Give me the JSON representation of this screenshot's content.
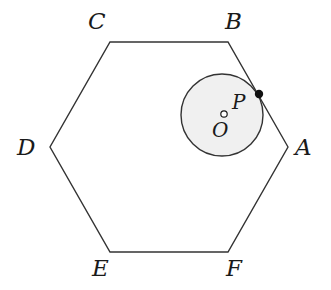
{
  "figure": {
    "kind": "geometry-diagram",
    "background_color": "#ffffff",
    "stroke_color": "#333333",
    "label_color": "#1a1a1a"
  },
  "hexagon": {
    "name": "ABCDEF",
    "stroke_color": "#333333",
    "stroke_width": 1.4,
    "fill": "none",
    "vertices": [
      {
        "label": "A",
        "x": 288,
        "y": 147,
        "label_x": 295,
        "label_y": 136
      },
      {
        "label": "B",
        "x": 228,
        "y": 42,
        "label_x": 225,
        "label_y": 10
      },
      {
        "label": "C",
        "x": 110,
        "y": 42,
        "label_x": 88,
        "label_y": 10
      },
      {
        "label": "D",
        "x": 50,
        "y": 147,
        "label_x": 17,
        "label_y": 136
      },
      {
        "label": "E",
        "x": 110,
        "y": 252,
        "label_x": 92,
        "label_y": 257
      },
      {
        "label": "F",
        "x": 228,
        "y": 252,
        "label_x": 226,
        "label_y": 257
      }
    ],
    "path": "M 288 147 L 228 42 L 110 42 L 50 147 L 110 252 L 228 252 Z"
  },
  "circle": {
    "name": "circle-O",
    "center_x": 222,
    "center_y": 115,
    "radius": 41,
    "fill_color": "#f0f0f0",
    "stroke_color": "#333333",
    "stroke_width": 1.4
  },
  "center_marker": {
    "name": "O",
    "x": 224,
    "y": 114,
    "radius": 3.2,
    "fill": "#ffffff",
    "stroke_color": "#1a1a1a",
    "label": "O",
    "label_x": 212,
    "label_y": 120
  },
  "tangent_point": {
    "name": "P",
    "x": 259,
    "y": 94,
    "radius": 4.2,
    "fill": "#111111",
    "label": "P",
    "label_x": 232,
    "label_y": 92
  }
}
